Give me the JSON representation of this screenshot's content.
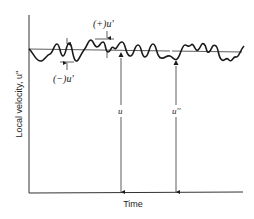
{
  "diagram": {
    "type": "turbulent velocity fluctuation sketch",
    "axes": {
      "x_label": "Time",
      "y_label": "Local velocity, u''"
    },
    "labels": {
      "plus_fluctuation": "(+)u'",
      "minus_fluctuation": "(−)u'",
      "mean_velocity": "u",
      "instantaneous_velocity": "u''"
    },
    "colors": {
      "line": "#1a1a1a",
      "background": "#ffffff"
    }
  }
}
